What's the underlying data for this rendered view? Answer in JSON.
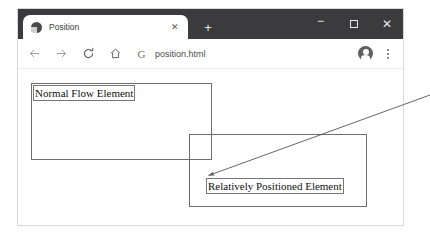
{
  "browser": {
    "tab": {
      "title": "Position",
      "favicon": "page-favicon",
      "close_label": "✕"
    },
    "new_tab_label": "+",
    "window_controls": {
      "minimize": "−",
      "maximize": "□",
      "close": "✕"
    },
    "toolbar": {
      "back": "back-arrow",
      "forward": "forward-arrow",
      "reload": "reload",
      "home": "home",
      "search_engine_glyph": "G",
      "url": "position.html",
      "profile": "account-avatar",
      "menu": "three-dot-menu"
    }
  },
  "page": {
    "normal_flow_label": "Normal Flow Element",
    "relative_label": "Relatively Positioned Element"
  },
  "annotation": {
    "pointer_target": "relatively-positioned-element",
    "color": "#555555"
  },
  "colors": {
    "titlebar": "#3b3b3d",
    "tab_background": "#ffffff",
    "box_border": "#6e6e6e",
    "text": "#101010"
  }
}
